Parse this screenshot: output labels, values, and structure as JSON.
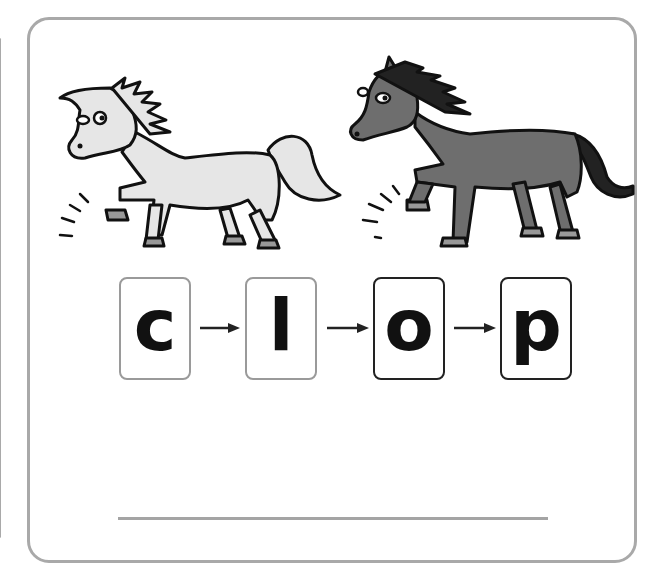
{
  "worksheet": {
    "images": [
      {
        "name": "white-horse",
        "fill": "#e6e6e6"
      },
      {
        "name": "dark-horse",
        "fill": "#6e6e6e"
      }
    ],
    "letters": [
      {
        "char": "c",
        "border": "gray"
      },
      {
        "char": "l",
        "border": "gray"
      },
      {
        "char": "o",
        "border": "black"
      },
      {
        "char": "p",
        "border": "black"
      }
    ],
    "answer_line": ""
  },
  "colors": {
    "card_border": "#a9a9a9",
    "letter": "#111111",
    "gray_box_border": "#9a9a9a",
    "black_box_border": "#222222"
  }
}
